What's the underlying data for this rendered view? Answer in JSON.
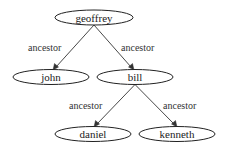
{
  "diagram": {
    "type": "directed-tree",
    "nodes": [
      {
        "id": "geoffrey",
        "label": "geoffrey",
        "cx": 94,
        "cy": 17.5,
        "rx": 39,
        "ry": 7.5
      },
      {
        "id": "john",
        "label": "john",
        "cx": 51,
        "cy": 77,
        "rx": 38,
        "ry": 7.5
      },
      {
        "id": "bill",
        "label": "bill",
        "cx": 135,
        "cy": 77,
        "rx": 38,
        "ry": 7.5
      },
      {
        "id": "daniel",
        "label": "daniel",
        "cx": 93,
        "cy": 134,
        "rx": 38,
        "ry": 7.5
      },
      {
        "id": "kenneth",
        "label": "kenneth",
        "cx": 177,
        "cy": 134,
        "rx": 38,
        "ry": 7.5
      }
    ],
    "edges": [
      {
        "from": "geoffrey",
        "to": "john",
        "label": "ancestor"
      },
      {
        "from": "geoffrey",
        "to": "bill",
        "label": "ancestor"
      },
      {
        "from": "bill",
        "to": "daniel",
        "label": "ancestor"
      },
      {
        "from": "bill",
        "to": "kenneth",
        "label": "ancestor"
      }
    ]
  }
}
